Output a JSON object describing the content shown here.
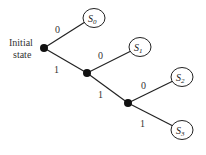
{
  "diagram": {
    "initial_label_line1": "Initial",
    "initial_label_line2": "state",
    "states": [
      {
        "name": "S",
        "sub": "0"
      },
      {
        "name": "S",
        "sub": "1"
      },
      {
        "name": "S",
        "sub": "2"
      },
      {
        "name": "S",
        "sub": "3"
      }
    ],
    "edges": [
      {
        "label": "0"
      },
      {
        "label": "1"
      },
      {
        "label": "0"
      },
      {
        "label": "1"
      },
      {
        "label": "0"
      },
      {
        "label": "1"
      }
    ]
  }
}
